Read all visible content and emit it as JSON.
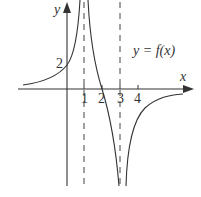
{
  "figure": {
    "function_label": "y = f(x)",
    "x_axis_label": "x",
    "y_axis_label": "y",
    "y_intercept_label": "2",
    "x_tick_labels": [
      "1",
      "2",
      "3",
      "4"
    ],
    "vertical_asymptotes": [
      1,
      3
    ],
    "x_intercept": 2,
    "y_intercept": 2,
    "curve_color": "#333333",
    "axis_color": "#333333"
  }
}
